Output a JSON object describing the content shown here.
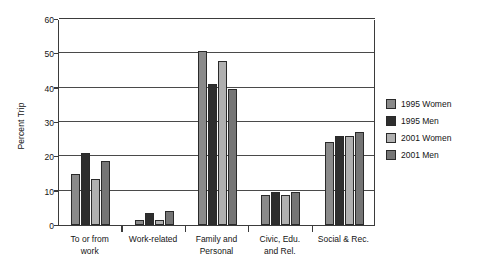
{
  "chart_data": {
    "type": "bar",
    "title": "",
    "xlabel": "",
    "ylabel": "Percent Trip",
    "ylim": [
      0,
      60
    ],
    "yticks": [
      0,
      10,
      20,
      30,
      40,
      50,
      60
    ],
    "grid": true,
    "legend_position": "right",
    "categories": [
      "To or from work",
      "Work-related",
      "Family and Personal",
      "Civic, Edu. and Rel.",
      "Social & Rec."
    ],
    "category_lines": [
      [
        "To or from",
        "work"
      ],
      [
        "Work-related"
      ],
      [
        "Family and",
        "Personal"
      ],
      [
        "Civic, Edu.",
        "and Rel."
      ],
      [
        "Social & Rec."
      ]
    ],
    "series": [
      {
        "name": "1995 Women",
        "color": "#8a8a8a",
        "values": [
          15.0,
          1.6,
          50.8,
          8.8,
          24.3
        ]
      },
      {
        "name": "1995 Men",
        "color": "#2e2e2e",
        "values": [
          20.9,
          3.5,
          41.0,
          9.6,
          25.8
        ]
      },
      {
        "name": "2001 Women",
        "color": "#b0b0b0",
        "values": [
          13.5,
          1.6,
          47.7,
          8.7,
          25.8
        ]
      },
      {
        "name": "2001 Men",
        "color": "#757575",
        "values": [
          18.5,
          4.1,
          39.7,
          9.6,
          27.0
        ]
      }
    ]
  }
}
